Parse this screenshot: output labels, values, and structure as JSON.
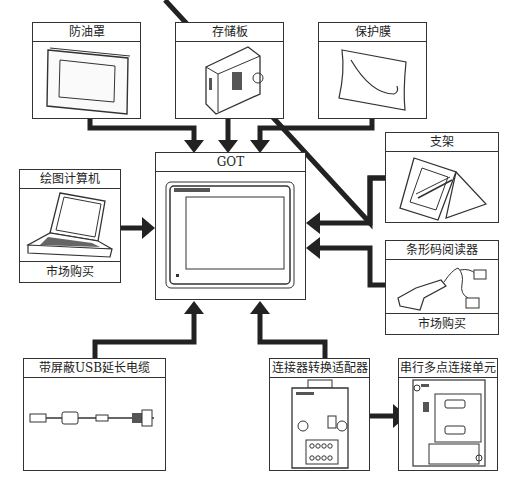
{
  "diagram": {
    "center": {
      "label": "GOT"
    },
    "top_items": [
      {
        "label": "防油罩"
      },
      {
        "label": "存储板"
      },
      {
        "label": "保护膜"
      }
    ],
    "left_items": [
      {
        "label": "绘图计算机",
        "footer": "市场购买"
      }
    ],
    "right_items": [
      {
        "label": "支架"
      },
      {
        "label": "条形码阅读器",
        "footer": "市场购买"
      }
    ],
    "bottom_items": [
      {
        "label": "带屏蔽USB延长电缆"
      },
      {
        "label": "连接器转换适配器"
      },
      {
        "label": "串行多点连接单元"
      }
    ],
    "colors": {
      "line": "#222222",
      "border": "#333333",
      "background": "#ffffff"
    }
  }
}
